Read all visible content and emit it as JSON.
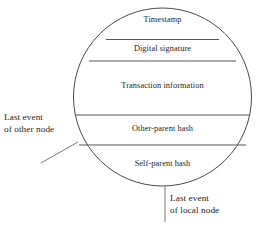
{
  "diagram": {
    "type": "hashgraph-event-circle",
    "shape": {
      "name": "event-circle",
      "cx": 162.5,
      "cy": 97,
      "r": 89
    },
    "bands": [
      {
        "id": "timestamp",
        "label": "Timestamp"
      },
      {
        "id": "digital-signature",
        "label": "Digital signature"
      },
      {
        "id": "transaction-information",
        "label": "Transaction information"
      },
      {
        "id": "other-parent-hash",
        "label": "Other-parent hash"
      },
      {
        "id": "self-parent-hash",
        "label": "Self-parent hash"
      }
    ],
    "dividers_y": [
      39.5,
      61,
      115,
      145
    ],
    "callouts": [
      {
        "id": "last-event-other-node",
        "line1": "Last event",
        "line2": "of other node",
        "leader": {
          "x1": 41,
          "y1": 163,
          "x2": 78,
          "y2": 142
        }
      },
      {
        "id": "last-event-local-node",
        "line1": "Last event",
        "line2": "of local node",
        "leader": {
          "x1": 165,
          "y1": 186,
          "x2": 165,
          "y2": 222
        }
      }
    ],
    "colors": {
      "stroke": "#4a4a4a",
      "divider": "#555555",
      "text": "#232323",
      "background": "#ffffff"
    }
  }
}
